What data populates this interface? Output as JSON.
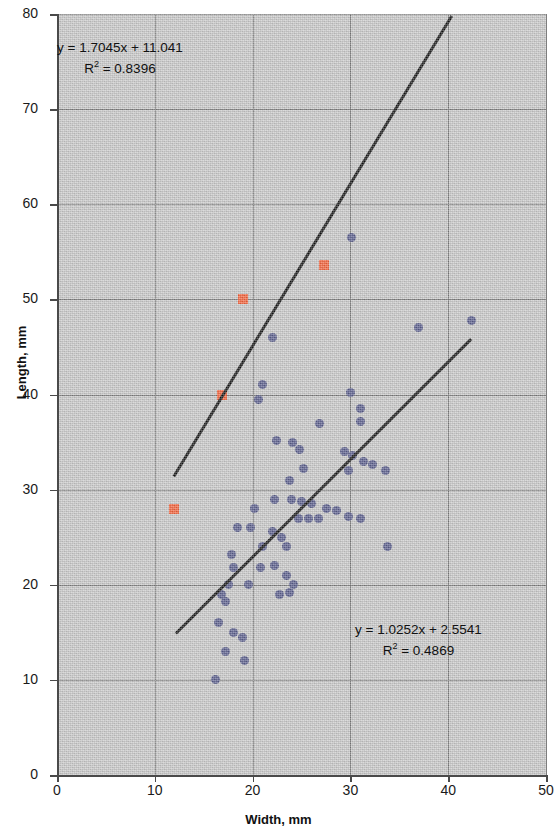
{
  "chart_data": {
    "type": "scatter",
    "title": "",
    "xlabel": "Width, mm",
    "ylabel": "Length, mm",
    "xlim": [
      0,
      50
    ],
    "ylim": [
      0,
      80
    ],
    "xticks": [
      0,
      10,
      20,
      30,
      40,
      50
    ],
    "yticks": [
      0,
      10,
      20,
      30,
      40,
      50,
      60,
      70,
      80
    ],
    "grid": true,
    "legend": "none",
    "colors": {
      "series_blue": "#5a5e8c",
      "series_orange": "#f4623a",
      "trendline": "#151515",
      "plot_background": "#c9c9c9",
      "gridline": "#7d7d7d"
    },
    "series": [
      {
        "name": "Series 1",
        "marker": "circle",
        "color": "#5a5e8c",
        "points": [
          [
            30.1,
            56.5
          ],
          [
            22.0,
            46.0
          ],
          [
            37.0,
            47.0
          ],
          [
            42.4,
            47.8
          ],
          [
            21.0,
            41.0
          ],
          [
            20.6,
            39.5
          ],
          [
            30.0,
            40.2
          ],
          [
            31.0,
            38.5
          ],
          [
            31.0,
            37.2
          ],
          [
            26.8,
            37.0
          ],
          [
            22.4,
            35.2
          ],
          [
            24.1,
            35.0
          ],
          [
            24.8,
            34.2
          ],
          [
            29.4,
            34.0
          ],
          [
            30.2,
            33.6
          ],
          [
            31.3,
            33.0
          ],
          [
            32.3,
            32.6
          ],
          [
            33.6,
            32.0
          ],
          [
            29.8,
            32.0
          ],
          [
            25.2,
            32.2
          ],
          [
            23.8,
            31.0
          ],
          [
            22.2,
            29.0
          ],
          [
            24.0,
            29.0
          ],
          [
            25.0,
            28.8
          ],
          [
            26.0,
            28.5
          ],
          [
            27.6,
            28.0
          ],
          [
            28.6,
            27.8
          ],
          [
            29.8,
            27.2
          ],
          [
            31.0,
            27.0
          ],
          [
            26.7,
            27.0
          ],
          [
            25.7,
            27.0
          ],
          [
            24.7,
            27.0
          ],
          [
            33.8,
            24.0
          ],
          [
            20.2,
            28.0
          ],
          [
            18.5,
            26.0
          ],
          [
            19.8,
            26.0
          ],
          [
            22.0,
            25.6
          ],
          [
            23.0,
            25.0
          ],
          [
            23.5,
            24.0
          ],
          [
            21.0,
            24.0
          ],
          [
            17.8,
            23.2
          ],
          [
            18.0,
            21.8
          ],
          [
            22.2,
            22.0
          ],
          [
            20.8,
            21.8
          ],
          [
            23.5,
            21.0
          ],
          [
            24.2,
            20.0
          ],
          [
            22.8,
            19.0
          ],
          [
            23.8,
            19.2
          ],
          [
            17.5,
            20.0
          ],
          [
            19.6,
            20.0
          ],
          [
            16.8,
            19.0
          ],
          [
            17.2,
            18.2
          ],
          [
            16.5,
            16.0
          ],
          [
            18.0,
            15.0
          ],
          [
            19.0,
            14.5
          ],
          [
            17.2,
            13.0
          ],
          [
            16.2,
            10.0
          ],
          [
            19.2,
            12.0
          ]
        ]
      },
      {
        "name": "Series 2",
        "marker": "square",
        "color": "#f4623a",
        "points": [
          [
            27.3,
            53.6
          ],
          [
            19.0,
            50.0
          ],
          [
            16.9,
            40.0
          ],
          [
            12.0,
            28.0
          ]
        ]
      }
    ],
    "trendlines": [
      {
        "for_series": "Series 2",
        "equation": "y = 1.7045x + 11.041",
        "r_squared_label": "R",
        "r_squared_exp": "2",
        "r_squared_value": "= 0.8396",
        "slope": 1.7045,
        "intercept": 11.041,
        "x_start": 12.0,
        "x_end": 40.4
      },
      {
        "for_series": "Series 1",
        "equation": "y = 1.0252x + 2.5541",
        "r_squared_label": "R",
        "r_squared_exp": "2",
        "r_squared_value": "= 0.4869",
        "slope": 1.0252,
        "intercept": 2.5541,
        "x_start": 12.2,
        "x_end": 42.4
      }
    ],
    "annotations": [
      {
        "id": "eq-top",
        "line1": "y = 1.7045x + 11.041",
        "r_label": "R",
        "r_exp": "2",
        "r_rest": " = 0.8396",
        "x_px": 57,
        "y_px": 38
      },
      {
        "id": "eq-bottom",
        "line1": "y = 1.0252x + 2.5541",
        "r_label": "R",
        "r_exp": "2",
        "r_rest": " = 0.4869",
        "x_px": 355,
        "y_px": 620
      }
    ]
  }
}
